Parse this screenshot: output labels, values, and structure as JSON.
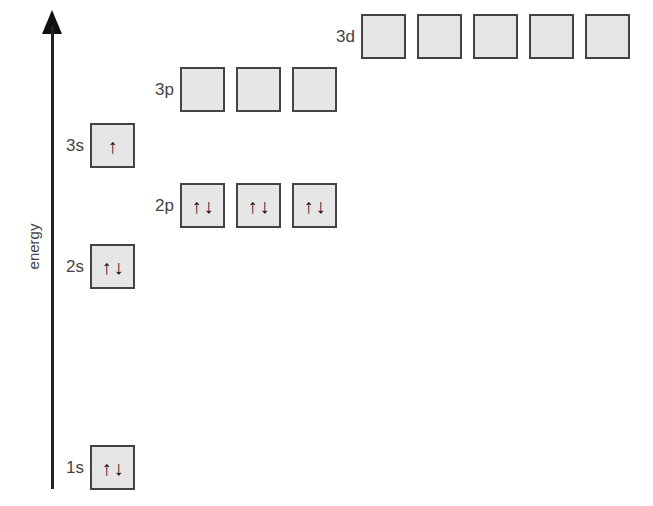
{
  "axis": {
    "label": "energy"
  },
  "arrow_glyphs": {
    "up": "↑",
    "down": "↓"
  },
  "sublevels": [
    {
      "id": "1s",
      "label": "1s",
      "orbitals": [
        {
          "spins": [
            "↑",
            "↓"
          ]
        }
      ]
    },
    {
      "id": "2s",
      "label": "2s",
      "orbitals": [
        {
          "spins": [
            "↑",
            "↓"
          ]
        }
      ]
    },
    {
      "id": "2p",
      "label": "2p",
      "orbitals": [
        {
          "spins": [
            "↑",
            "↓"
          ]
        },
        {
          "spins": [
            "↑",
            "↓"
          ]
        },
        {
          "spins": [
            "↑",
            "↓"
          ]
        }
      ]
    },
    {
      "id": "3s",
      "label": "3s",
      "orbitals": [
        {
          "spins": [
            "↑"
          ]
        }
      ]
    },
    {
      "id": "3p",
      "label": "3p",
      "orbitals": [
        {
          "spins": []
        },
        {
          "spins": []
        },
        {
          "spins": []
        }
      ]
    },
    {
      "id": "3d",
      "label": "3d",
      "orbitals": [
        {
          "spins": []
        },
        {
          "spins": []
        },
        {
          "spins": []
        },
        {
          "spins": []
        },
        {
          "spins": []
        }
      ]
    }
  ],
  "colors": {
    "box_fill": "#e6e6e6",
    "box_border": "#444444",
    "axis": "#222222"
  }
}
